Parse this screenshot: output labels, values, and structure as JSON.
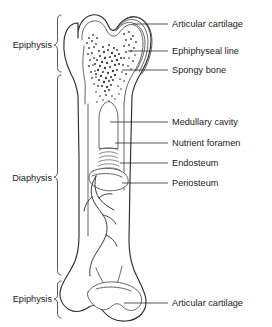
{
  "figure": {
    "background_color": "#ffffff",
    "ink_color": "#2f2f2f",
    "text_color": "#1a1a1a"
  },
  "left_labels": [
    {
      "id": "epiphysis-proximal",
      "text": "Epiphysis",
      "x": 52,
      "y": 45,
      "brace_top": 15,
      "brace_bottom": 72
    },
    {
      "id": "diaphysis",
      "text": "Diaphysis",
      "x": 52,
      "y": 178,
      "brace_top": 75,
      "brace_bottom": 275
    },
    {
      "id": "epiphysis-distal",
      "text": "Epiphysis",
      "x": 52,
      "y": 299,
      "brace_top": 281,
      "brace_bottom": 318
    }
  ],
  "right_labels": [
    {
      "id": "articular-cartilage-top",
      "text": "Articular cartilage",
      "x": 172,
      "y": 24,
      "leader_x1": 133,
      "leader_y1": 24,
      "leader_x2": 168,
      "leader_y2": 24
    },
    {
      "id": "epiphyseal-line",
      "text": "Ephiphyseal line",
      "x": 172,
      "y": 51,
      "leader_x1": 128,
      "leader_y1": 51,
      "leader_x2": 168,
      "leader_y2": 51
    },
    {
      "id": "spongy-bone",
      "text": "Spongy bone",
      "x": 172,
      "y": 70,
      "leader_x1": 122,
      "leader_y1": 70,
      "leader_x2": 168,
      "leader_y2": 70
    },
    {
      "id": "medullary-cavity",
      "text": "Medullary cavity",
      "x": 172,
      "y": 122,
      "leader_x1": 110,
      "leader_y1": 122,
      "leader_x2": 168,
      "leader_y2": 122
    },
    {
      "id": "nutrient-foramen",
      "text": "Nutrient foramen",
      "x": 172,
      "y": 143,
      "leader_x1": 115,
      "leader_y1": 143,
      "leader_x2": 168,
      "leader_y2": 143
    },
    {
      "id": "endosteum",
      "text": "Endosteum",
      "x": 172,
      "y": 163,
      "leader_x1": 120,
      "leader_y1": 163,
      "leader_x2": 168,
      "leader_y2": 163
    },
    {
      "id": "periosteum",
      "text": "Periosteum",
      "x": 172,
      "y": 183,
      "leader_x1": 122,
      "leader_y1": 183,
      "leader_x2": 168,
      "leader_y2": 183
    },
    {
      "id": "articular-cartilage-bottom",
      "text": "Articular cartilage",
      "x": 172,
      "y": 303,
      "leader_x1": 124,
      "leader_y1": 303,
      "leader_x2": 168,
      "leader_y2": 303
    }
  ],
  "structures": [
    {
      "id": "proximal-epiphysis",
      "name": "proximal epiphysis"
    },
    {
      "id": "articular-cartilage-layers",
      "name": "articular cartilage layered lines"
    },
    {
      "id": "spongy-bone-stipple",
      "name": "spongy bone trabecular stippling"
    },
    {
      "id": "epiphyseal-line-mark",
      "name": "epiphyseal line"
    },
    {
      "id": "medullary-cavity-shape",
      "name": "medullary cavity"
    },
    {
      "id": "compact-bone-wall",
      "name": "compact bone cortical wall"
    },
    {
      "id": "endosteum-hatching",
      "name": "endosteum hatched band"
    },
    {
      "id": "periosteum-flap",
      "name": "peeled periosteum flap"
    },
    {
      "id": "nutrient-artery",
      "name": "nutrient artery and branches"
    },
    {
      "id": "distal-epiphysis",
      "name": "distal epiphysis condyles"
    }
  ]
}
